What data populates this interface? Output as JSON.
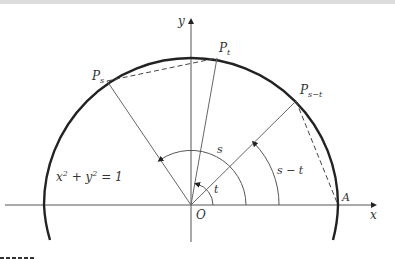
{
  "figure": {
    "axes": {
      "x_label": "x",
      "y_label": "y",
      "origin_label": "O"
    },
    "points": {
      "A": "A",
      "P_s": {
        "base": "P",
        "sub": "s"
      },
      "P_t": {
        "base": "P",
        "sub": "t"
      },
      "P_s_minus_t": {
        "base": "P",
        "sub": "s−t"
      }
    },
    "angles": {
      "s": "s",
      "t": "t",
      "s_minus_t": "s − t"
    },
    "equation": {
      "lhs_x": "x",
      "sup1": "2",
      "plus": " + y",
      "sup2": "2",
      "rhs": " = 1"
    },
    "colors": {
      "circle": "#222222",
      "lines": "#555555",
      "text": "#333333"
    }
  }
}
